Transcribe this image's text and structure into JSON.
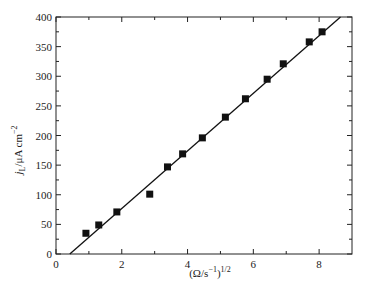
{
  "chart_data": {
    "type": "scatter",
    "title": "",
    "xlabel": "(Ω/s⁻¹)^1/2",
    "xlabel_parts": {
      "base": "(Ω/s",
      "sup1": "−1",
      "mid": ")",
      "sup2": "1/2"
    },
    "ylabel": "jL/μA cm^-2",
    "ylabel_parts": {
      "j": "j",
      "sub": "L",
      "unit": "/μA cm",
      "sup": "−2"
    },
    "xlim": [
      0,
      9
    ],
    "ylim": [
      0,
      400
    ],
    "xticks": [
      0,
      2,
      4,
      6,
      8
    ],
    "xminor": [
      1,
      3,
      5,
      7
    ],
    "yticks": [
      0,
      50,
      100,
      150,
      200,
      250,
      300,
      350,
      400
    ],
    "yminor": [
      25,
      75,
      125,
      175,
      225,
      275,
      325,
      375
    ],
    "grid": false,
    "legend": null,
    "series": [
      {
        "name": "data",
        "marker": "square",
        "color": "#111111",
        "x": [
          0.91,
          1.3,
          1.85,
          2.85,
          3.39,
          3.85,
          4.45,
          5.15,
          5.76,
          6.42,
          6.91,
          7.7,
          8.09
        ],
        "y": [
          35,
          49,
          71,
          101,
          147,
          169,
          196,
          231,
          262,
          295,
          321,
          358,
          375
        ]
      },
      {
        "name": "linear fit",
        "type": "line",
        "color": "#111111",
        "x": [
          0.42,
          8.65
        ],
        "y": [
          0,
          400
        ]
      }
    ]
  }
}
